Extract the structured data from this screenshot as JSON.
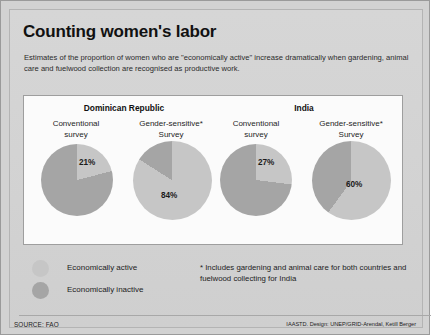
{
  "poster": {
    "title": "Counting women's labor",
    "subtitle": "Estimates of the proportion of women who are \"economically  active\" increase dramatically when gardening, animal care and fuelwood collection are recognised as productive work.",
    "footnote": "* Includes gardening and animal care for both countries and fuelwood collecting for India",
    "source": "SOURCE: FAO",
    "credit": "IAASTD. Design: UNEP/GRID-Arendal, Ketill Berger"
  },
  "colors": {
    "active": "#c6c6c6",
    "inactive": "#a5a5a5",
    "background": "#d2d2d2",
    "panel": "#fbfbfb"
  },
  "groups": [
    {
      "country": "Dominican Republic"
    },
    {
      "country": "India"
    }
  ],
  "legend": {
    "items": [
      {
        "label": "Economically active",
        "color": "#c6c6c6"
      },
      {
        "label": "Economically inactive",
        "color": "#a5a5a5"
      }
    ]
  },
  "chart_data": {
    "type": "pie",
    "title": "Counting women's labor",
    "subtitle": "Estimates of the proportion of women who are \"economically  active\" increase dramatically when gardening, animal care and fuelwood collection are recognised as productive work.",
    "legend": [
      "Economically active",
      "Economically inactive"
    ],
    "legend_position": "bottom-left",
    "units": "percent",
    "charts": [
      {
        "country": "Dominican Republic",
        "survey_label_line1": "Conventional",
        "survey_label_line2": "survey",
        "gender_sensitive": false,
        "value_label": "21%",
        "slices": [
          {
            "name": "Economically active",
            "value": 21,
            "color": "#c6c6c6"
          },
          {
            "name": "Economically inactive",
            "value": 79,
            "color": "#a5a5a5"
          }
        ]
      },
      {
        "country": "Dominican Republic",
        "survey_label_line1": "Gender-sensitive*",
        "survey_label_line2": "Survey",
        "gender_sensitive": true,
        "value_label": "84%",
        "slices": [
          {
            "name": "Economically active",
            "value": 84,
            "color": "#c6c6c6"
          },
          {
            "name": "Economically inactive",
            "value": 16,
            "color": "#a5a5a5"
          }
        ]
      },
      {
        "country": "India",
        "survey_label_line1": "Conventional",
        "survey_label_line2": "survey",
        "gender_sensitive": false,
        "value_label": "27%",
        "slices": [
          {
            "name": "Economically active",
            "value": 27,
            "color": "#c6c6c6"
          },
          {
            "name": "Economically inactive",
            "value": 73,
            "color": "#a5a5a5"
          }
        ]
      },
      {
        "country": "India",
        "survey_label_line1": "Gender-sensitive*",
        "survey_label_line2": "Survey",
        "gender_sensitive": true,
        "value_label": "60%",
        "slices": [
          {
            "name": "Economically active",
            "value": 60,
            "color": "#c6c6c6"
          },
          {
            "name": "Economically inactive",
            "value": 40,
            "color": "#a5a5a5"
          }
        ]
      }
    ]
  }
}
